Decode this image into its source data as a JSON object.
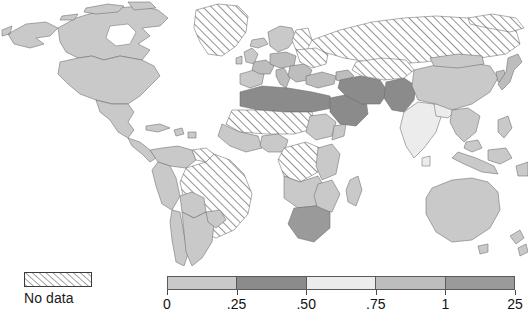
{
  "figure": {
    "type": "choropleth-world-map",
    "background_color": "#ffffff"
  },
  "map": {
    "name": "world-choropleth",
    "projection": "equirectangular-like",
    "ocean_color": "#ffffff",
    "border_color": "#6b6b6b",
    "coast_color": "#3a3a3a",
    "regions": [
      {
        "name": "greenland",
        "class": "nodata"
      },
      {
        "name": "canada",
        "class": "bin1"
      },
      {
        "name": "alaska",
        "class": "bin1"
      },
      {
        "name": "united-states",
        "class": "bin1"
      },
      {
        "name": "mexico",
        "class": "bin1"
      },
      {
        "name": "central-america",
        "class": "bin1"
      },
      {
        "name": "caribbean",
        "class": "bin1"
      },
      {
        "name": "colombia-venezuela",
        "class": "bin1"
      },
      {
        "name": "brazil",
        "class": "nodata"
      },
      {
        "name": "peru-bolivia-chile",
        "class": "bin1"
      },
      {
        "name": "argentina",
        "class": "bin1"
      },
      {
        "name": "western-europe",
        "class": "bin1"
      },
      {
        "name": "central-europe",
        "class": "bin4"
      },
      {
        "name": "iberia",
        "class": "bin1"
      },
      {
        "name": "italy",
        "class": "bin4"
      },
      {
        "name": "balkans",
        "class": "bin4"
      },
      {
        "name": "ukraine-belarus",
        "class": "nodata"
      },
      {
        "name": "russia",
        "class": "nodata"
      },
      {
        "name": "turkey",
        "class": "bin4"
      },
      {
        "name": "north-africa-morocco-algeria-libya-egypt",
        "class": "bin2"
      },
      {
        "name": "sahel-mauritania-mali-niger-chad-sudan",
        "class": "nodata"
      },
      {
        "name": "west-africa-coast",
        "class": "bin1"
      },
      {
        "name": "central-africa-drc",
        "class": "nodata"
      },
      {
        "name": "east-africa-ethiopia-kenya-tanzania",
        "class": "bin1"
      },
      {
        "name": "southern-africa-angola-zambia-zimbabwe",
        "class": "bin1"
      },
      {
        "name": "south-africa",
        "class": "bin5"
      },
      {
        "name": "madagascar",
        "class": "bin1"
      },
      {
        "name": "arabian-peninsula-saudi-arabia",
        "class": "bin2"
      },
      {
        "name": "iraq-iran",
        "class": "bin2"
      },
      {
        "name": "afghanistan-pakistan",
        "class": "bin2"
      },
      {
        "name": "central-asia",
        "class": "nodata"
      },
      {
        "name": "india",
        "class": "bin3"
      },
      {
        "name": "nepal-bangladesh",
        "class": "bin3"
      },
      {
        "name": "sri-lanka",
        "class": "bin3"
      },
      {
        "name": "china",
        "class": "bin1"
      },
      {
        "name": "mongolia",
        "class": "bin1"
      },
      {
        "name": "korea-japan",
        "class": "bin4"
      },
      {
        "name": "southeast-asia",
        "class": "bin1"
      },
      {
        "name": "indonesia",
        "class": "bin1"
      },
      {
        "name": "philippines",
        "class": "bin1"
      },
      {
        "name": "australia",
        "class": "bin1"
      },
      {
        "name": "new-zealand",
        "class": "bin1"
      },
      {
        "name": "papua-new-guinea",
        "class": "bin1"
      }
    ]
  },
  "legend": {
    "nodata": {
      "label": "No data",
      "pattern": "diagonal-hatch",
      "swatch_fill": "#ffffff",
      "hatch_color": "#3b3b3b"
    },
    "scale": {
      "segments": [
        {
          "index": 1,
          "color": "#c9c9c9",
          "range": "0 – .25"
        },
        {
          "index": 2,
          "color": "#8b8b8b",
          "range": ".25 – .50"
        },
        {
          "index": 3,
          "color": "#ececec",
          "range": ".50 – .75"
        },
        {
          "index": 4,
          "color": "#bdbdbd",
          "range": ".75 – 1"
        },
        {
          "index": 5,
          "color": "#9a9a9a",
          "range": "1 – 25"
        }
      ],
      "tick_labels": [
        "0",
        ".25",
        ".50",
        ".75",
        "1",
        "25"
      ],
      "tick_positions_pct": [
        0,
        20,
        40,
        60,
        80,
        100
      ]
    }
  },
  "colors": {
    "bin1": "#c9c9c9",
    "bin2": "#8b8b8b",
    "bin3": "#ececec",
    "bin4": "#bdbdbd",
    "bin5": "#9a9a9a",
    "nodata_hatch": "#3b3b3b",
    "border": "#6b6b6b",
    "text": "#111111"
  }
}
